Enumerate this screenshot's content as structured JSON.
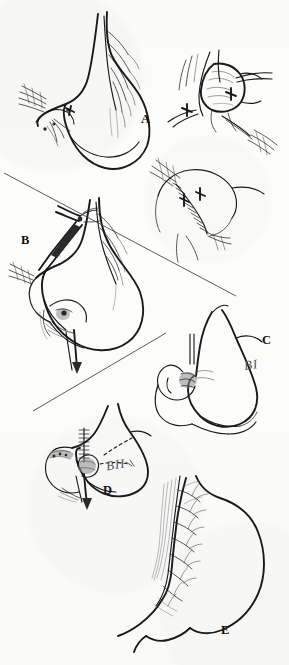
{
  "figure": {
    "kind": "medical-surgical-illustration",
    "width": 289,
    "height": 665,
    "background_color": "#fdfdfc",
    "ink_color": "#1a1a1a",
    "annotation_color": "#555555"
  },
  "panels": [
    {
      "id": "A",
      "label": "A",
      "label_x": 144,
      "label_y": 119,
      "title": "Truncal vagotomy exposure",
      "content": "Stomach with lesser curvature and branching nerve of Latarjet; esophagogastric junction retracted, cross markers at hiatus"
    },
    {
      "id": "A2",
      "label": "",
      "title": "Hiatal close-up",
      "content": "Magnified view of the esophageal hiatus with retracted crura and two cross marks on dissected nerve trunks"
    },
    {
      "id": "A3",
      "label": "",
      "title": "Sutured closure",
      "content": "Closed gastric incision with interrupted suture line and two cross marks"
    },
    {
      "id": "B",
      "label": "B",
      "label_x": 24,
      "label_y": 240,
      "title": "Antrectomy with clamp",
      "content": "Surgical clamp applied across the vagal trunks, stomach transected at antrum with arrow indicating resection direction"
    },
    {
      "id": "C",
      "label": "C",
      "label_x": 265,
      "label_y": 340,
      "title": "Billroth I reconstruction",
      "annotation": "BI",
      "annotation_x": 246,
      "annotation_y": 366,
      "content": "Gastroduodenostomy: remaining stomach joined end-to-end to duodenum"
    },
    {
      "id": "D",
      "label": "D",
      "label_x": 106,
      "label_y": 490,
      "title": "Billroth II reconstruction",
      "annotation": "BII",
      "annotation_x": 108,
      "annotation_y": 466,
      "content": "Gastrojejunostomy: duodenal stump closed with staple line, jejunal loop anastomosed to stomach"
    },
    {
      "id": "E",
      "label": "E",
      "label_x": 224,
      "label_y": 630,
      "title": "Highly selective vagotomy",
      "content": "Stomach with divided nerve branches along lesser curvature, nerve of Latarjet preserved to antrum"
    }
  ],
  "annotations": [
    {
      "text": "BI",
      "meaning": "Billroth I"
    },
    {
      "text": "BII",
      "meaning": "Billroth II"
    }
  ],
  "dividers": [
    {
      "name": "divider-upper",
      "x1": 4,
      "y1": 173,
      "x2": 236,
      "y2": 296
    },
    {
      "name": "divider-lower",
      "x1": 33,
      "y1": 411,
      "x2": 166,
      "y2": 333
    }
  ]
}
